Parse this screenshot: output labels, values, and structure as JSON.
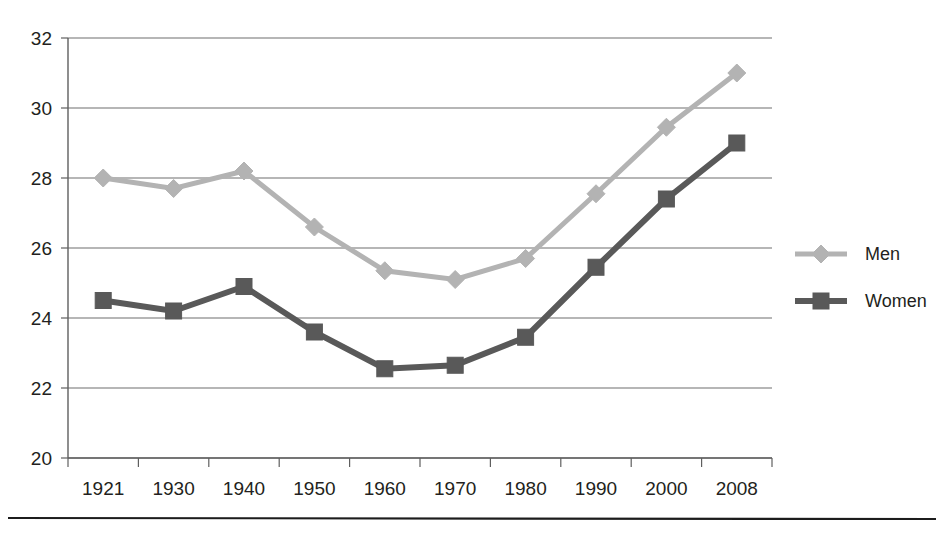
{
  "chart_data": {
    "type": "line",
    "title": "",
    "subtitle": "",
    "xlabel": "",
    "ylabel": "",
    "categories": [
      "1921",
      "1930",
      "1940",
      "1950",
      "1960",
      "1970",
      "1980",
      "1990",
      "2000",
      "2008"
    ],
    "series": [
      {
        "name": "Men",
        "color": "#b3b3b3",
        "marker": "diamond",
        "values": [
          28.0,
          27.7,
          28.2,
          26.6,
          25.35,
          25.1,
          25.7,
          27.55,
          29.45,
          31.0
        ]
      },
      {
        "name": "Women",
        "color": "#595959",
        "marker": "square",
        "values": [
          24.5,
          24.2,
          24.9,
          23.6,
          22.55,
          22.65,
          23.45,
          25.45,
          27.4,
          29.0
        ]
      }
    ],
    "ylim": [
      20,
      32
    ],
    "yticks": [
      20,
      22,
      24,
      26,
      28,
      30,
      32
    ],
    "ytick_labels": [
      "20",
      "22",
      "24",
      "26",
      "28",
      "30",
      "32"
    ],
    "grid": true,
    "grid_axis": "y",
    "legend_position": "right",
    "legend_entries": [
      "Men",
      "Women"
    ],
    "background_color": "#ffffff",
    "gridline_color": "#6f6f6f",
    "axis_color": "#5f5f5f",
    "footer_rule": true
  }
}
